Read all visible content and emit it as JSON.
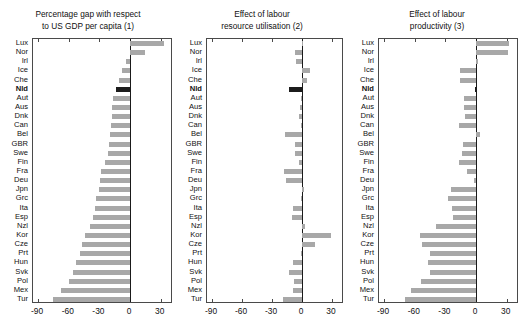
{
  "figure": {
    "background": "#ffffff",
    "bar_color": "#a8a8a8",
    "highlight_color": "#1c1c1c",
    "axis_color": "#4a4a4a",
    "highlighted_country": "Nld"
  },
  "chart_data": [
    {
      "type": "bar",
      "orientation": "horizontal",
      "title": "Percentage gap with respect to US GDP per capita (1)",
      "title_lines": [
        "Percentage gap with respect",
        "to US GDP per capita (1)"
      ],
      "xlabel": "",
      "ylabel": "",
      "xlim": [
        -95,
        42
      ],
      "xticks": [
        -90,
        -60,
        -30,
        0,
        30
      ],
      "xticklabels": [
        "-90",
        "-60",
        "-30",
        "0",
        "30"
      ],
      "grid": false,
      "legend": "none",
      "categories": [
        "Lux",
        "Nor",
        "Irl",
        "Ice",
        "Che",
        "Nld",
        "Aut",
        "Aus",
        "Dnk",
        "Can",
        "Bel",
        "GBR",
        "Swe",
        "Fin",
        "Fra",
        "Deu",
        "Jpn",
        "Grc",
        "Ita",
        "Esp",
        "Nzl",
        "Kor",
        "Cze",
        "Prt",
        "Hun",
        "Svk",
        "Pol",
        "Mex",
        "Tur"
      ],
      "values": [
        33,
        15,
        -4,
        -8,
        -11,
        -14,
        -17,
        -18,
        -18,
        -19,
        -20,
        -21,
        -22,
        -25,
        -28,
        -29,
        -30,
        -33,
        -34,
        -36,
        -39,
        -44,
        -47,
        -49,
        -53,
        -56,
        -60,
        -68,
        -75
      ]
    },
    {
      "type": "bar",
      "orientation": "horizontal",
      "title": "Effect of labour resource utilisation (2)",
      "title_lines": [
        "Effect of labour",
        "resource utilisation (2)"
      ],
      "xlabel": "",
      "ylabel": "",
      "xlim": [
        -95,
        42
      ],
      "xticks": [
        -90,
        -60,
        -30,
        0,
        30
      ],
      "xticklabels": [
        "-90",
        "-60",
        "-30",
        "0",
        "30"
      ],
      "grid": false,
      "legend": "none",
      "categories": [
        "Lux",
        "Nor",
        "Irl",
        "Ice",
        "Che",
        "Nld",
        "Aut",
        "Aus",
        "Dnk",
        "Can",
        "Bel",
        "GBR",
        "Swe",
        "Fin",
        "Fra",
        "Deu",
        "Jpn",
        "Grc",
        "Ita",
        "Esp",
        "Nzl",
        "Kor",
        "Cze",
        "Prt",
        "Hun",
        "Svk",
        "Pol",
        "Mex",
        "Tur"
      ],
      "values": [
        1,
        -7,
        -6,
        8,
        5,
        -13,
        -1,
        -2,
        -3,
        -1,
        -17,
        -7,
        -7,
        -3,
        -18,
        -16,
        2,
        -1,
        -9,
        -10,
        3,
        29,
        13,
        -1,
        -9,
        -13,
        -8,
        -9,
        -19
      ]
    },
    {
      "type": "bar",
      "orientation": "horizontal",
      "title": "Effect of labour productivity (3)",
      "title_lines": [
        "Effect of labour",
        "productivity (3)"
      ],
      "xlabel": "",
      "ylabel": "",
      "xlim": [
        -95,
        42
      ],
      "xticks": [
        -90,
        -60,
        -30,
        0,
        30
      ],
      "xticklabels": [
        "-90",
        "-60",
        "-30",
        "0",
        "30"
      ],
      "grid": false,
      "legend": "none",
      "categories": [
        "Lux",
        "Nor",
        "Irl",
        "Ice",
        "Che",
        "Nld",
        "Aut",
        "Aus",
        "Dnk",
        "Can",
        "Bel",
        "GBR",
        "Swe",
        "Fin",
        "Fra",
        "Deu",
        "Jpn",
        "Grc",
        "Ita",
        "Esp",
        "Nzl",
        "Kor",
        "Cze",
        "Prt",
        "Hun",
        "Svk",
        "Pol",
        "Mex",
        "Tur"
      ],
      "values": [
        32,
        31,
        2,
        -16,
        -16,
        -1,
        -12,
        -12,
        -11,
        -17,
        4,
        -13,
        -14,
        -17,
        -9,
        -2,
        -25,
        -27,
        -24,
        -23,
        -39,
        -55,
        -53,
        -45,
        -47,
        -45,
        -54,
        -64,
        -70
      ]
    }
  ]
}
